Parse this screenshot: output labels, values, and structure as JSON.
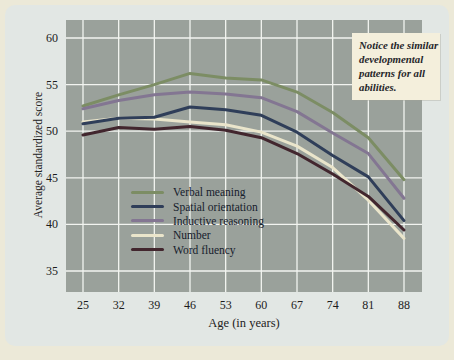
{
  "figure": {
    "annotation": {
      "lines": [
        "Notice the similar",
        "developmental",
        "patterns for all",
        "abilities."
      ]
    }
  },
  "chart_data": {
    "type": "line",
    "title": "",
    "xlabel": "Age (in years)",
    "ylabel": "Average standardized score",
    "x": [
      25,
      32,
      39,
      46,
      53,
      60,
      67,
      74,
      81,
      88
    ],
    "yticks": [
      35,
      40,
      45,
      50,
      55,
      60
    ],
    "ylim": [
      33,
      62
    ],
    "grid": true,
    "legend_position": "inside-lower-left",
    "series": [
      {
        "name": "Verbal meaning",
        "color": "#7c8d64",
        "values": [
          52.7,
          53.9,
          55.0,
          56.2,
          55.7,
          55.5,
          54.2,
          52.0,
          49.3,
          44.8
        ]
      },
      {
        "name": "Spatial orientation",
        "color": "#2f3e59",
        "values": [
          50.8,
          51.4,
          51.5,
          52.6,
          52.3,
          51.7,
          49.9,
          47.4,
          45.1,
          40.4
        ]
      },
      {
        "name": "Inductive reasoning",
        "color": "#837692",
        "values": [
          52.4,
          53.3,
          53.9,
          54.2,
          54.0,
          53.6,
          52.1,
          49.8,
          47.6,
          42.8
        ]
      },
      {
        "name": "Number",
        "color": "#eae5cb",
        "values": [
          51.0,
          51.4,
          51.3,
          51.0,
          50.7,
          49.9,
          48.4,
          46.1,
          42.6,
          38.5
        ]
      },
      {
        "name": "Word fluency",
        "color": "#42262e",
        "values": [
          49.6,
          50.4,
          50.2,
          50.5,
          50.1,
          49.3,
          47.6,
          45.4,
          43.0,
          39.4
        ]
      }
    ],
    "colors": {
      "page_bg": "#ece9d8",
      "panel_bg": "#e2e7e4",
      "plot_bg": "#9aa19b",
      "gridline": "#f2f4f0",
      "tick_text": "#1c1c1c",
      "annotation_bg": "#f4efdc"
    }
  }
}
